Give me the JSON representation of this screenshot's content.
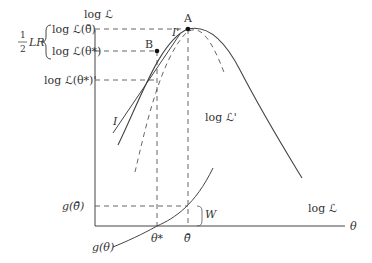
{
  "diagram": {
    "type": "likelihood-ratio-wald-score-illustration",
    "axes": {
      "y_label": "log ℒ",
      "x_label": "θ"
    },
    "points": [
      {
        "name": "A",
        "label": "A",
        "x": 188,
        "y": 29
      },
      {
        "name": "B",
        "label": "B",
        "x": 157,
        "y": 51
      }
    ],
    "y_tick_labels": {
      "log_l_hat": "log ℒ(θ̄)",
      "log_l_star": "log ℒ(θ*)",
      "log_l_star_prime": "log ℒ(θ*)'",
      "g_hat": "g(θ̄)"
    },
    "bracket_label": {
      "fraction_num": "1",
      "fraction_den": "2",
      "text": "LR"
    },
    "x_tick_labels": {
      "theta_star": "θ*",
      "theta_hat": "θ̄"
    },
    "curve_labels": {
      "log_l": "log ℒ",
      "log_l_prime": "log ℒ'",
      "g_theta": "g(θ)",
      "tangent_upper": "I'",
      "tangent_lower": "I",
      "w": "W"
    },
    "colors": {
      "line": "#444444",
      "dashed": "#555555",
      "text": "#333333",
      "point": "#111111"
    }
  }
}
